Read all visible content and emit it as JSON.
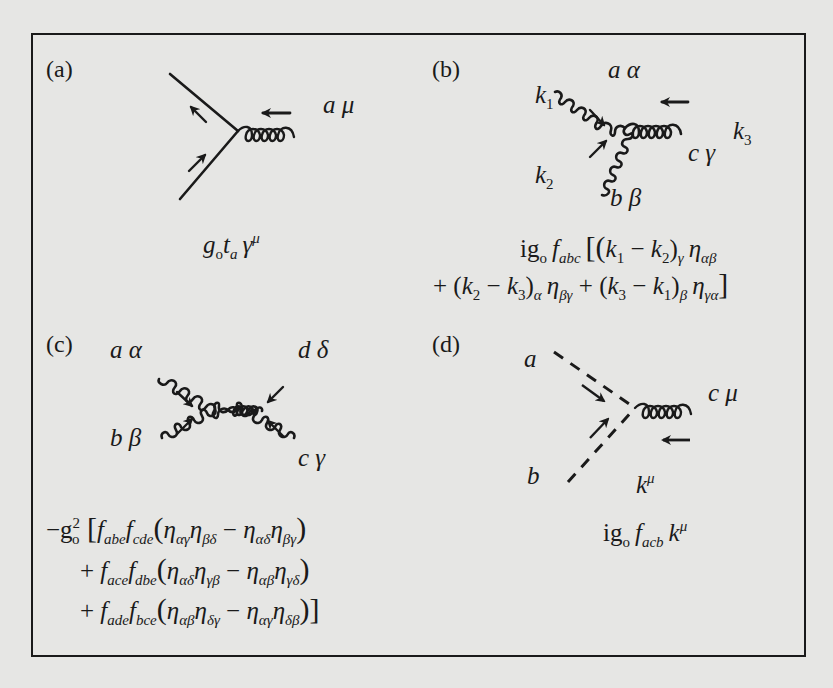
{
  "figure": {
    "panels": [
      {
        "id": "a",
        "label": "(a)",
        "particles": {
          "gluon": "a μ"
        },
        "vertex_rule": {
          "prefix": "g",
          "sub0": "o",
          "t": "t",
          "t_sub": "a",
          "gamma": "γ",
          "gamma_sup": "μ"
        },
        "description": "quark-quark-gluon vertex"
      },
      {
        "id": "b",
        "label": "(b)",
        "particles": {
          "top": "a α",
          "bottom": "b β",
          "right": "c γ",
          "k1": "k",
          "k1_sub": "1",
          "k2": "k",
          "k2_sub": "2",
          "k3": "k",
          "k3_sub": "3"
        },
        "vertex_rule": {
          "line1": {
            "prefix": "ig",
            "sub0": "o",
            "f": "f",
            "f_sub": "abc",
            "open": "[(",
            "k1": "k",
            "k1s": "1",
            "minus": " − ",
            "k2": "k",
            "k2s": "2",
            "close1": ")",
            "idx1": "γ",
            "eta": "η",
            "eta_sub": "αβ"
          },
          "line2": {
            "plus": "+ (",
            "k2": "k",
            "k2s": "2",
            "minus": " − ",
            "k3": "k",
            "k3s": "3",
            "close": ")",
            "idx": "α",
            "eta1": "η",
            "eta1_sub": "βγ",
            "plus2": " + (",
            "k3b": "k",
            "k3bs": "3",
            "minus2": " − ",
            "k1": "k",
            "k1s": "1",
            "close2": ")",
            "idx2": "β",
            "eta2": "η",
            "eta2_sub": "γα",
            "end": "]"
          }
        },
        "description": "three-gluon vertex"
      },
      {
        "id": "c",
        "label": "(c)",
        "particles": {
          "top_left": "a α",
          "top_right": "d δ",
          "bottom_left": "b β",
          "bottom_right": "c γ"
        },
        "vertex_rule": {
          "line1": {
            "minus": "−g",
            "sup": "2",
            "sub": "o",
            "open": " [",
            "f1": "f",
            "f1s": "abe",
            "f2": "f",
            "f2s": "cde",
            "p_open": "(",
            "e1": "η",
            "e1s": "αγ",
            "e2": "η",
            "e2s": "βδ",
            "m": " − ",
            "e3": "η",
            "e3s": "αδ",
            "e4": "η",
            "e4s": "βγ",
            "p_close": ")"
          },
          "line2": {
            "plus": "+ ",
            "f1": "f",
            "f1s": "ace",
            "f2": "f",
            "f2s": "dbe",
            "p_open": "(",
            "e1": "η",
            "e1s": "αδ",
            "e2": "η",
            "e2s": "γβ",
            "m": " − ",
            "e3": "η",
            "e3s": "αβ",
            "e4": "η",
            "e4s": "γδ",
            "p_close": ")"
          },
          "line3": {
            "plus": "+ ",
            "f1": "f",
            "f1s": "ade",
            "f2": "f",
            "f2s": "bce",
            "p_open": "(",
            "e1": "η",
            "e1s": "αβ",
            "e2": "η",
            "e2s": "δγ",
            "m": " − ",
            "e3": "η",
            "e3s": "αγ",
            "e4": "η",
            "e4s": "δβ",
            "p_close": ")]"
          }
        },
        "description": "four-gluon vertex"
      },
      {
        "id": "d",
        "label": "(d)",
        "particles": {
          "ghost_a": "a",
          "ghost_b": "b",
          "gluon": "c μ",
          "momentum": "k",
          "momentum_sup": "μ"
        },
        "vertex_rule": {
          "prefix": "ig",
          "sub0": "o",
          "f": "f",
          "f_sub": "acb",
          "k": "k",
          "k_sup": "μ"
        },
        "description": "ghost-ghost-gluon vertex"
      }
    ],
    "colors": {
      "ink": "#1a1a1a",
      "paper": "#e6e6e4"
    }
  }
}
